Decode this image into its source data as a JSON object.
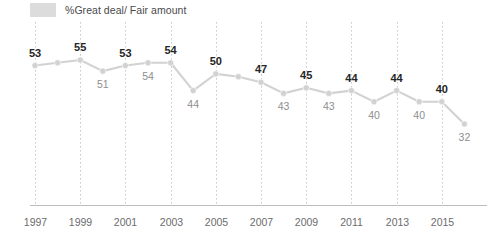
{
  "legend": {
    "label": "%Great deal/ Fair amount",
    "swatch_color": "#dcdcdc",
    "swatch_icon": "legend-swatch-icon"
  },
  "colors": {
    "line": "#d2d2d2",
    "marker": "#d2d2d2",
    "gridline": "#c9c9c9",
    "axis": "#bdbdbd",
    "major_label": "#252525",
    "minor_label": "#8e8e8e",
    "tick_label": "#6b6b6d"
  },
  "chart_data": {
    "type": "line",
    "title": "",
    "subtitle": "",
    "xlabel": "",
    "ylabel": "",
    "xlim": [
      1997,
      2016
    ],
    "ylim": [
      28,
      60
    ],
    "grid": true,
    "grid_axis": "x",
    "legend_position": "top-left",
    "series": [
      {
        "name": "%Great deal/ Fair amount",
        "x": [
          1997,
          1998,
          1999,
          2000,
          2001,
          2002,
          2003,
          2004,
          2005,
          2006,
          2007,
          2008,
          2009,
          2010,
          2011,
          2012,
          2013,
          2014,
          2015,
          2016
        ],
        "values": [
          53,
          54,
          55,
          51,
          53,
          54,
          54,
          44,
          50,
          49,
          47,
          43,
          45,
          43,
          44,
          40,
          44,
          40,
          40,
          32
        ]
      }
    ],
    "point_labels": [
      {
        "x": 1997,
        "value": 53,
        "text": "53",
        "emphasis": "major",
        "position": "above"
      },
      {
        "x": 1998,
        "value": 54,
        "text": "",
        "emphasis": "none",
        "position": "none"
      },
      {
        "x": 1999,
        "value": 55,
        "text": "55",
        "emphasis": "major",
        "position": "above"
      },
      {
        "x": 2000,
        "value": 51,
        "text": "51",
        "emphasis": "minor",
        "position": "below"
      },
      {
        "x": 2001,
        "value": 53,
        "text": "53",
        "emphasis": "major",
        "position": "above"
      },
      {
        "x": 2002,
        "value": 54,
        "text": "54",
        "emphasis": "minor",
        "position": "below"
      },
      {
        "x": 2003,
        "value": 54,
        "text": "54",
        "emphasis": "major",
        "position": "above"
      },
      {
        "x": 2004,
        "value": 44,
        "text": "44",
        "emphasis": "minor",
        "position": "below"
      },
      {
        "x": 2005,
        "value": 50,
        "text": "50",
        "emphasis": "major",
        "position": "above"
      },
      {
        "x": 2006,
        "value": 49,
        "text": "",
        "emphasis": "none",
        "position": "none"
      },
      {
        "x": 2007,
        "value": 47,
        "text": "47",
        "emphasis": "major",
        "position": "above"
      },
      {
        "x": 2008,
        "value": 43,
        "text": "43",
        "emphasis": "minor",
        "position": "below"
      },
      {
        "x": 2009,
        "value": 45,
        "text": "45",
        "emphasis": "major",
        "position": "above"
      },
      {
        "x": 2010,
        "value": 43,
        "text": "43",
        "emphasis": "minor",
        "position": "below"
      },
      {
        "x": 2011,
        "value": 44,
        "text": "44",
        "emphasis": "major",
        "position": "above"
      },
      {
        "x": 2012,
        "value": 40,
        "text": "40",
        "emphasis": "minor",
        "position": "below"
      },
      {
        "x": 2013,
        "value": 44,
        "text": "44",
        "emphasis": "major",
        "position": "above"
      },
      {
        "x": 2014,
        "value": 40,
        "text": "40",
        "emphasis": "minor",
        "position": "below"
      },
      {
        "x": 2015,
        "value": 40,
        "text": "40",
        "emphasis": "major",
        "position": "above"
      },
      {
        "x": 2016,
        "value": 32,
        "text": "32",
        "emphasis": "minor",
        "position": "below"
      }
    ],
    "xticks": [
      1997,
      1999,
      2001,
      2003,
      2005,
      2007,
      2009,
      2011,
      2013,
      2015
    ],
    "xtick_labels": [
      "1997",
      "1999",
      "2001",
      "2003",
      "2005",
      "2007",
      "2009",
      "2011",
      "2013",
      "2015"
    ]
  }
}
